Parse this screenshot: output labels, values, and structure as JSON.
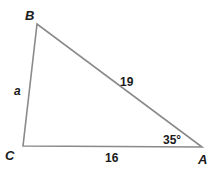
{
  "diagram": {
    "type": "triangle",
    "vertices": {
      "B": {
        "label": "B"
      },
      "C": {
        "label": "C"
      },
      "A": {
        "label": "A"
      }
    },
    "sides": {
      "BC": {
        "label": "a"
      },
      "AB": {
        "label": "19"
      },
      "CA": {
        "label": "16"
      }
    },
    "angles": {
      "A": {
        "label": "35°"
      }
    },
    "line_color": "#8a8a8a",
    "text_color": "#1a1a1a"
  }
}
